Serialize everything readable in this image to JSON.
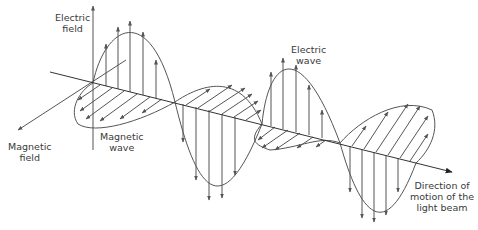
{
  "diagram": {
    "colors": {
      "stroke": "#555555",
      "text": "#3a3a3a",
      "background": "#ffffff"
    },
    "labels": {
      "electric_field": {
        "line1": "Electric",
        "line2": "field"
      },
      "magnetic_field": {
        "line1": "Magnetic",
        "line2": "field"
      },
      "magnetic_wave": {
        "line1": "Magnetic",
        "line2": "wave"
      },
      "electric_wave": {
        "line1": "Electric",
        "line2": "wave"
      },
      "direction": {
        "line1": "Direction of",
        "line2": "motion of the",
        "line3": "light beam"
      }
    },
    "axes": {
      "origin": [
        93,
        83
      ],
      "propagation_axis": {
        "from": [
          50,
          72
        ],
        "to": [
          452,
          172
        ]
      },
      "electric_axis": {
        "from": [
          93,
          150
        ],
        "to": [
          93,
          5
        ]
      },
      "magnetic_axis": {
        "from": [
          126,
          60
        ],
        "to": [
          17,
          131
        ]
      }
    },
    "nodes_x": [
      93,
      175,
      262,
      340,
      416
    ]
  }
}
